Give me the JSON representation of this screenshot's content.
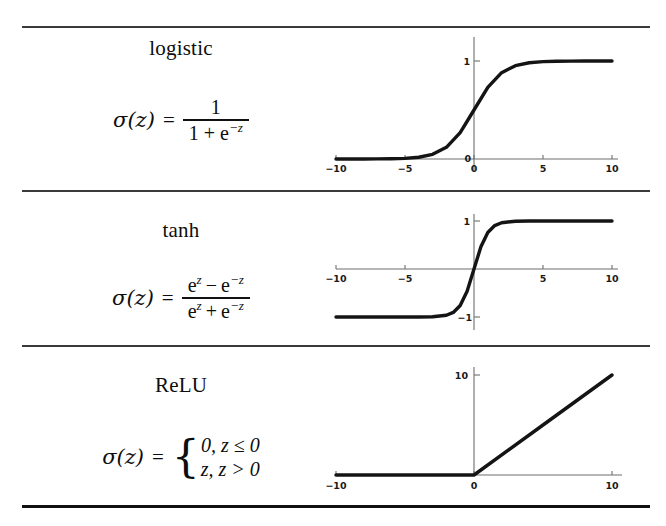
{
  "figure": {
    "rows": [
      {
        "name": "logistic",
        "formula": {
          "lhs": "σ(z)",
          "eq": "=",
          "type": "fraction",
          "numerator": "1",
          "denominator_pre": "1 + e",
          "denominator_exp": "−z"
        }
      },
      {
        "name": "tanh",
        "formula": {
          "lhs": "σ(z)",
          "eq": "=",
          "type": "fraction",
          "numerator_a": "e",
          "numerator_a_exp": "z",
          "numerator_op": "−",
          "numerator_b": "e",
          "numerator_b_exp": "−z",
          "denominator_a": "e",
          "denominator_a_exp": "z",
          "denominator_op": "+",
          "denominator_b": "e",
          "denominator_b_exp": "−z"
        }
      },
      {
        "name": "ReLU",
        "formula": {
          "lhs": "σ(z)",
          "eq": "=",
          "type": "cases",
          "brace": "{",
          "case1": "0, z ≤ 0",
          "case2": "z, z > 0"
        }
      }
    ]
  },
  "chart_data": [
    {
      "type": "line",
      "title": "logistic",
      "xlabel": "",
      "ylabel": "",
      "xlim": [
        -10,
        10
      ],
      "ylim": [
        0,
        1
      ],
      "grid": false,
      "legend": "none",
      "xticks": [
        -10,
        -5,
        0,
        5,
        10
      ],
      "xticklabels": [
        "−10",
        "−5",
        "0",
        "5",
        "10"
      ],
      "yticks": [
        0,
        1
      ],
      "yticklabels": [
        "0",
        "1"
      ],
      "series": [
        {
          "name": "logistic",
          "x": [
            -10,
            -9,
            -8,
            -7,
            -6,
            -5,
            -4,
            -3,
            -2,
            -1,
            0,
            1,
            2,
            3,
            4,
            5,
            6,
            7,
            8,
            9,
            10
          ],
          "y": [
            0.0,
            0.0001,
            0.0003,
            0.0009,
            0.0025,
            0.0067,
            0.018,
            0.0474,
            0.1192,
            0.2689,
            0.5,
            0.7311,
            0.8808,
            0.9526,
            0.982,
            0.9933,
            0.9975,
            0.9991,
            0.9997,
            0.9999,
            1.0
          ]
        }
      ]
    },
    {
      "type": "line",
      "title": "tanh",
      "xlabel": "",
      "ylabel": "",
      "xlim": [
        -10,
        10
      ],
      "ylim": [
        -1,
        1
      ],
      "grid": false,
      "legend": "none",
      "xticks": [
        -10,
        -5,
        0,
        5,
        10
      ],
      "xticklabels": [
        "−10",
        "−5",
        "0",
        "5",
        "10"
      ],
      "yticks": [
        -1,
        1
      ],
      "yticklabels": [
        "−1",
        "1"
      ],
      "series": [
        {
          "name": "tanh",
          "x": [
            -10,
            -9,
            -8,
            -7,
            -6,
            -5,
            -4,
            -3,
            -2,
            -1.5,
            -1,
            -0.5,
            0,
            0.5,
            1,
            1.5,
            2,
            3,
            4,
            5,
            6,
            7,
            8,
            9,
            10
          ],
          "y": [
            -1.0,
            -1.0,
            -1.0,
            -1.0,
            -0.9999,
            -0.9999,
            -0.9993,
            -0.9951,
            -0.964,
            -0.9051,
            -0.7616,
            -0.4621,
            0.0,
            0.4621,
            0.7616,
            0.9051,
            0.964,
            0.9951,
            0.9993,
            0.9999,
            0.9999,
            1.0,
            1.0,
            1.0,
            1.0
          ]
        }
      ]
    },
    {
      "type": "line",
      "title": "ReLU",
      "xlabel": "",
      "ylabel": "",
      "xlim": [
        -10,
        10
      ],
      "ylim": [
        0,
        10
      ],
      "grid": false,
      "legend": "none",
      "xticks": [
        -10,
        0,
        10
      ],
      "xticklabels": [
        "−10",
        "0",
        "10"
      ],
      "yticks": [
        10
      ],
      "yticklabels": [
        "10"
      ],
      "series": [
        {
          "name": "ReLU",
          "x": [
            -10,
            -5,
            0,
            5,
            10
          ],
          "y": [
            0,
            0,
            0,
            5,
            10
          ]
        }
      ]
    }
  ]
}
